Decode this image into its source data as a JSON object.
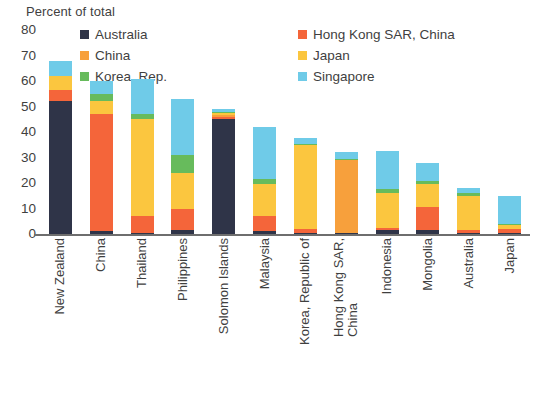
{
  "chart_data": {
    "type": "bar",
    "title": "",
    "subtitle": "",
    "ylabel": "Percent of total",
    "xlabel": "",
    "ylim": [
      0,
      80
    ],
    "ytick_step": 10,
    "yticks": [
      80,
      70,
      60,
      50,
      40,
      30,
      20,
      10,
      0
    ],
    "grid": false,
    "stacked": true,
    "legend_position": "top",
    "categories": [
      "New Zealand",
      "China",
      "Thailand",
      "Philippines",
      "Solomon Islands",
      "Malaysia",
      "Korea, Republic of",
      "Hong Kong SAR,\nChina",
      "Indonesia",
      "Mongolia",
      "Australia",
      "Japan"
    ],
    "series": [
      {
        "name": "Australia",
        "color": "#2f3448",
        "values": [
          52.0,
          1.0,
          0.5,
          1.5,
          45.0,
          1.0,
          0.5,
          0.5,
          1.5,
          1.5,
          0.5,
          0.5
        ]
      },
      {
        "name": "Hong Kong SAR, China",
        "color": "#f4653a",
        "values": [
          4.5,
          46.0,
          6.5,
          8.5,
          1.0,
          6.0,
          1.5,
          0.0,
          1.0,
          9.0,
          1.0,
          1.5
        ]
      },
      {
        "name": "China",
        "color": "#f7a03c",
        "values": [
          0.0,
          0.0,
          0.0,
          0.0,
          0.5,
          0.0,
          0.0,
          28.5,
          0.0,
          0.0,
          0.0,
          0.0
        ]
      },
      {
        "name": "Japan",
        "color": "#fbc63f",
        "values": [
          5.5,
          5.0,
          38.0,
          14.0,
          1.0,
          12.5,
          33.0,
          0.0,
          13.5,
          9.0,
          13.5,
          1.5
        ]
      },
      {
        "name": "Korea, Rep.",
        "color": "#67bb5c",
        "values": [
          0.0,
          3.0,
          2.0,
          7.0,
          0.5,
          2.0,
          0.5,
          0.5,
          1.5,
          1.5,
          1.0,
          0.5
        ]
      },
      {
        "name": "Singapore",
        "color": "#6fcbe8",
        "values": [
          6.0,
          5.0,
          14.0,
          22.0,
          1.0,
          20.5,
          2.0,
          2.5,
          15.0,
          7.0,
          2.0,
          11.0
        ]
      }
    ],
    "totals": [
      68,
      60,
      61,
      53,
      49,
      42,
      37.5,
      32,
      32.5,
      28,
      18,
      15
    ],
    "legend": {
      "column_1": [
        "Australia",
        "China",
        "Korea, Rep."
      ],
      "column_2": [
        "Hong Kong SAR, China",
        "Japan",
        "Singapore"
      ]
    },
    "legend_colors": {
      "Australia": "#2f3448",
      "China": "#f7a03c",
      "Korea, Rep.": "#67bb5c",
      "Hong Kong SAR, China": "#f4653a",
      "Japan": "#fbc63f",
      "Singapore": "#6fcbe8"
    }
  }
}
